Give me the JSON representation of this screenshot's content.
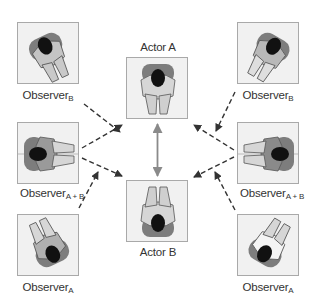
{
  "diagram": {
    "nodes": [
      {
        "id": "observer-b-left",
        "label": "Observer",
        "subscript": "B",
        "position": "top-left"
      },
      {
        "id": "actor-a",
        "label": "Actor A",
        "position": "top-center"
      },
      {
        "id": "observer-b-right",
        "label": "Observer",
        "subscript": "B",
        "position": "top-right"
      },
      {
        "id": "observer-ab-left",
        "label": "Observer",
        "subscript": "A + B",
        "position": "middle-left"
      },
      {
        "id": "observer-ab-right",
        "label": "Observer",
        "subscript": "A + B",
        "position": "middle-right"
      },
      {
        "id": "actor-b",
        "label": "Actor B",
        "position": "bottom-center"
      },
      {
        "id": "observer-a-left",
        "label": "Observer",
        "subscript": "A",
        "position": "bottom-left"
      },
      {
        "id": "observer-a-right",
        "label": "Observer",
        "subscript": "A",
        "position": "bottom-right"
      }
    ],
    "edges": [
      {
        "from": "actor-a",
        "to": "actor-b",
        "style": "solid",
        "direction": "bidirectional"
      },
      {
        "from": "observer-b-left",
        "to": "actor-b",
        "style": "dashed"
      },
      {
        "from": "observer-b-right",
        "to": "actor-b",
        "style": "dashed"
      },
      {
        "from": "observer-ab-left",
        "to": "actor-a",
        "style": "dashed"
      },
      {
        "from": "observer-ab-left",
        "to": "actor-b",
        "style": "dashed"
      },
      {
        "from": "observer-ab-right",
        "to": "actor-a",
        "style": "dashed"
      },
      {
        "from": "observer-ab-right",
        "to": "actor-b",
        "style": "dashed"
      },
      {
        "from": "observer-a-left",
        "to": "actor-a",
        "style": "dashed"
      },
      {
        "from": "observer-a-right",
        "to": "actor-a",
        "style": "dashed"
      }
    ],
    "colors": {
      "box_fill": "#f1f1f1",
      "box_border": "#a9a9a9",
      "arrow_solid": "#8a8a8a",
      "arrow_dashed": "#333333"
    }
  }
}
